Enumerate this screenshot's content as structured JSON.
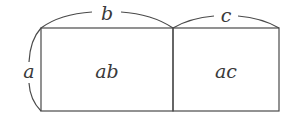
{
  "diagram": {
    "stroke_color": "#4a4a4a",
    "text_color": "#3a3a3a",
    "rectangles": [
      {
        "id": "left",
        "label": "ab",
        "x": 41,
        "y": 28,
        "width": 132,
        "height": 83
      },
      {
        "id": "right",
        "label": "ac",
        "x": 173,
        "y": 28,
        "width": 106,
        "height": 83
      }
    ],
    "dimension_labels": {
      "height": "a",
      "left_width": "b",
      "right_width": "c"
    }
  }
}
